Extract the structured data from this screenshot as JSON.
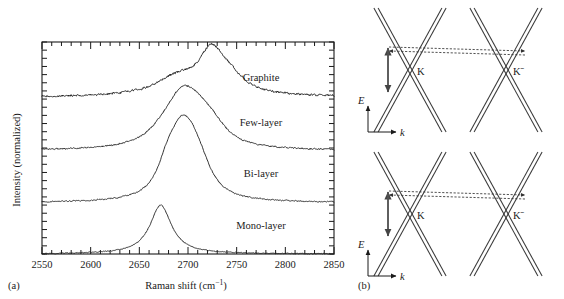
{
  "figure": {
    "panel_a_label": "(a)",
    "panel_b_label": "(b)"
  },
  "panel_a": {
    "xlabel_main": "Raman shift (cm",
    "xlabel_unit": "−1",
    "xlabel_close": ")",
    "ylabel": "Intensity (normalized)",
    "xticks": [
      "2550",
      "2600",
      "2650",
      "2700",
      "2750",
      "2800",
      "2850"
    ],
    "curve_labels": [
      {
        "name": "graphite-label",
        "text": "Graphite"
      },
      {
        "name": "few-layer-label",
        "text": "Few-layer"
      },
      {
        "name": "bi-layer-label",
        "text": "Bi-layer"
      },
      {
        "name": "mono-layer-label",
        "text": "Mono-layer"
      }
    ]
  },
  "panel_b": {
    "diagrams": [
      {
        "name": "upper-band-diagram",
        "k_label": "K",
        "kprime_label": "Kˉ",
        "energy_axis_label": "E",
        "momentum_axis_label": "k"
      },
      {
        "name": "lower-band-diagram",
        "k_label": "K",
        "kprime_label": "Kˉ",
        "energy_axis_label": "E",
        "momentum_axis_label": "k"
      }
    ]
  },
  "chart_data": {
    "type": "line",
    "title": "",
    "xlabel": "Raman shift (cm−1)",
    "ylabel": "Intensity (normalized)",
    "xlim": [
      2550,
      2850
    ],
    "ylim": [
      0,
      4.35
    ],
    "grid": false,
    "legend": "inline-right-labels",
    "xticks_major": [
      2550,
      2600,
      2650,
      2700,
      2750,
      2800,
      2850
    ],
    "minor_ticks_per_major": 5,
    "y_axis_ticks": "minor only, unlabeled",
    "series": [
      {
        "name": "Mono-layer",
        "offset": 0.0,
        "label_x": 2775,
        "label_y": 0.52,
        "noise": 0.012,
        "peaks": [
          {
            "center": 2672,
            "amplitude": 1.0,
            "width": 13.5,
            "shape": "lorentzian"
          }
        ]
      },
      {
        "name": "Bi-layer",
        "offset": 1.05,
        "label_x": 2775,
        "label_y": 1.58,
        "noise": 0.016,
        "peaks": [
          {
            "center": 2679,
            "amplitude": 0.6,
            "width": 13.0,
            "shape": "lorentzian"
          },
          {
            "center": 2692,
            "amplitude": 0.86,
            "width": 13.0,
            "shape": "lorentzian"
          },
          {
            "center": 2703,
            "amplitude": 0.78,
            "width": 14.0,
            "shape": "lorentzian"
          },
          {
            "center": 2714,
            "amplitude": 0.4,
            "width": 15.0,
            "shape": "lorentzian"
          }
        ]
      },
      {
        "name": "Few-layer",
        "offset": 2.12,
        "label_x": 2775,
        "label_y": 2.62,
        "noise": 0.02,
        "peaks": [
          {
            "center": 2678,
            "amplitude": 0.34,
            "width": 22.0,
            "shape": "lorentzian"
          },
          {
            "center": 2694,
            "amplitude": 0.74,
            "width": 17.0,
            "shape": "lorentzian"
          },
          {
            "center": 2710,
            "amplitude": 0.52,
            "width": 18.0,
            "shape": "lorentzian"
          },
          {
            "center": 2726,
            "amplitude": 0.3,
            "width": 18.0,
            "shape": "lorentzian"
          }
        ]
      },
      {
        "name": "Graphite",
        "offset": 3.22,
        "label_x": 2775,
        "label_y": 3.55,
        "noise": 0.03,
        "peaks": [
          {
            "center": 2688,
            "amplitude": 0.34,
            "width": 26.0,
            "shape": "lorentzian"
          },
          {
            "center": 2724,
            "amplitude": 0.8,
            "width": 16.0,
            "shape": "lorentzian"
          },
          {
            "center": 2742,
            "amplitude": 0.3,
            "width": 20.0,
            "shape": "lorentzian"
          }
        ]
      }
    ]
  }
}
